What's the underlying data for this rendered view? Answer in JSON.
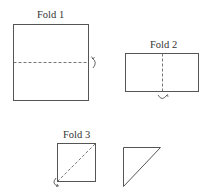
{
  "diagram": {
    "type": "paper-folding-sequence",
    "steps": [
      {
        "label": "Fold 1",
        "shape": "square",
        "fold_line": "horizontal-middle",
        "fold_direction": "curl-arrow-right"
      },
      {
        "label": "Fold 2",
        "shape": "rectangle",
        "fold_line": "vertical-middle",
        "fold_direction": "curl-arrow-bottom"
      },
      {
        "label": "Fold 3",
        "shape": "square",
        "fold_line": "diagonal-bottom-left-to-top-right",
        "fold_direction": "curl-arrow-bottom-left"
      }
    ],
    "result": {
      "shape": "right-triangle"
    },
    "colors": {
      "stroke": "#555555",
      "dash": "#666666",
      "text": "#333333",
      "background": "#ffffff"
    }
  }
}
